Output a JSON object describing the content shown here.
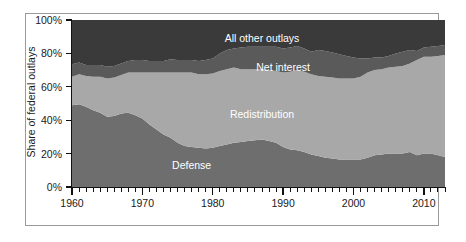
{
  "chart_data": {
    "type": "area",
    "stacked": true,
    "title": "",
    "subtitle": "",
    "xlabel": "",
    "ylabel": "Share of federal outlays",
    "xlim": [
      1960,
      2013
    ],
    "ylim": [
      0,
      100
    ],
    "grid": false,
    "legend_position": "inline-labels",
    "y_tick_labels": [
      "100%",
      "80%",
      "60%",
      "40%",
      "20%",
      "0%"
    ],
    "y_tick_values": [
      100,
      80,
      60,
      40,
      20,
      0
    ],
    "x_tick_labels": [
      "1960",
      "1970",
      "1980",
      "1990",
      "2000",
      "2010"
    ],
    "x_tick_values": [
      1960,
      1970,
      1980,
      1990,
      2000,
      2010
    ],
    "x_minor_tick_interval": 1,
    "units": "percent of total federal outlays",
    "x": [
      1960,
      1961,
      1962,
      1963,
      1964,
      1965,
      1966,
      1967,
      1968,
      1969,
      1970,
      1971,
      1972,
      1973,
      1974,
      1975,
      1976,
      1977,
      1978,
      1979,
      1980,
      1981,
      1982,
      1983,
      1984,
      1985,
      1986,
      1987,
      1988,
      1989,
      1990,
      1991,
      1992,
      1993,
      1994,
      1995,
      1996,
      1997,
      1998,
      1999,
      2000,
      2001,
      2002,
      2003,
      2004,
      2005,
      2006,
      2007,
      2008,
      2009,
      2010,
      2011,
      2012,
      2013
    ],
    "series": [
      {
        "name": "Defense",
        "color": "#6e6e6e",
        "label_color": "#ffffff",
        "stack_order": 1,
        "values": [
          49.0,
          49.5,
          48.0,
          46.0,
          44.5,
          42.0,
          42.5,
          44.0,
          44.5,
          43.0,
          41.0,
          37.5,
          34.5,
          31.5,
          29.5,
          26.5,
          24.5,
          24.0,
          23.5,
          23.0,
          23.5,
          24.5,
          25.5,
          26.5,
          27.0,
          27.5,
          28.0,
          28.5,
          27.5,
          26.5,
          24.0,
          22.5,
          22.0,
          21.0,
          19.5,
          18.5,
          17.5,
          17.0,
          16.5,
          16.5,
          16.5,
          16.5,
          17.5,
          19.0,
          19.5,
          20.0,
          20.0,
          20.0,
          21.0,
          19.0,
          20.0,
          20.0,
          19.0,
          18.0
        ]
      },
      {
        "name": "Redistribution",
        "color": "#a8a8a8",
        "label_color": "#ffffff",
        "stack_order": 2,
        "values": [
          17.0,
          18.0,
          18.5,
          20.0,
          21.5,
          23.0,
          23.0,
          23.0,
          24.0,
          25.5,
          27.5,
          31.0,
          34.0,
          37.0,
          39.0,
          42.0,
          44.0,
          44.5,
          44.0,
          44.5,
          44.5,
          45.0,
          45.0,
          45.0,
          43.5,
          43.0,
          42.5,
          42.0,
          42.5,
          43.0,
          44.5,
          46.5,
          48.0,
          48.0,
          48.0,
          48.0,
          48.5,
          48.5,
          48.5,
          48.5,
          48.5,
          49.5,
          51.0,
          51.0,
          51.0,
          51.5,
          52.0,
          52.5,
          53.0,
          57.0,
          58.0,
          58.0,
          59.5,
          61.0
        ]
      },
      {
        "name": "Net interest",
        "color": "#5a5a5a",
        "label_color": "#ffffff",
        "stack_order": 3,
        "values": [
          7.5,
          7.0,
          6.5,
          7.0,
          7.0,
          7.0,
          7.0,
          7.0,
          7.0,
          7.5,
          7.5,
          7.0,
          7.0,
          7.0,
          8.0,
          7.5,
          7.5,
          7.5,
          8.0,
          8.5,
          9.0,
          10.5,
          11.5,
          11.5,
          13.0,
          13.5,
          13.5,
          13.5,
          14.0,
          14.5,
          14.5,
          14.5,
          14.5,
          14.0,
          13.5,
          15.5,
          15.5,
          15.0,
          14.5,
          13.5,
          12.5,
          11.0,
          8.5,
          7.5,
          7.0,
          7.0,
          8.0,
          8.5,
          8.0,
          5.5,
          5.5,
          6.0,
          6.0,
          6.0
        ]
      },
      {
        "name": "All other outlays",
        "color": "#3a3a3a",
        "label_color": "#ffffff",
        "stack_order": 4,
        "values": [
          26.5,
          25.5,
          27.0,
          27.0,
          27.0,
          28.0,
          27.5,
          26.0,
          24.5,
          24.0,
          24.0,
          24.5,
          24.5,
          24.5,
          23.5,
          24.0,
          24.0,
          24.0,
          24.5,
          24.0,
          23.0,
          20.0,
          18.0,
          17.0,
          16.5,
          16.0,
          16.0,
          16.0,
          16.0,
          16.0,
          17.0,
          16.5,
          15.5,
          17.0,
          19.0,
          18.0,
          18.5,
          19.5,
          20.5,
          21.5,
          22.5,
          23.0,
          23.0,
          22.5,
          22.5,
          21.5,
          20.0,
          19.0,
          18.0,
          18.5,
          16.5,
          16.0,
          15.5,
          15.0
        ]
      }
    ]
  },
  "axes": {
    "y_title": "Share of federal outlays"
  },
  "colors": {
    "defense": "#6e6e6e",
    "redistribution": "#a8a8a8",
    "net_interest": "#5a5a5a",
    "all_other_outlays": "#3a3a3a",
    "frame": "#9a9a9a",
    "axis": "#111111",
    "background": "#ffffff",
    "text": "#1a1a1a",
    "label_text": "#ffffff"
  },
  "series_labels": [
    {
      "text": "All other outlays",
      "x_year": 1987,
      "y_pct": 89
    },
    {
      "text": "Net interest",
      "x_year": 1990,
      "y_pct": 72
    },
    {
      "text": "Redistribution",
      "x_year": 1987,
      "y_pct": 44
    },
    {
      "text": "Defense",
      "x_year": 1977,
      "y_pct": 13
    }
  ]
}
